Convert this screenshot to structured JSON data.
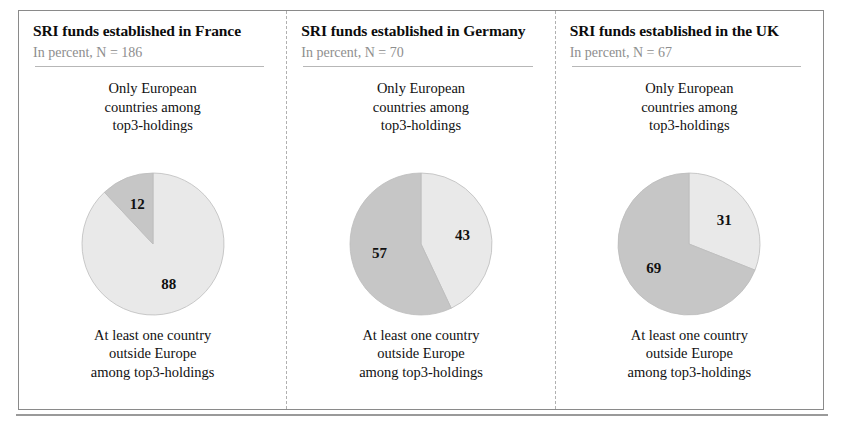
{
  "figure": {
    "border_color": "#8a8a8a",
    "separator_style": "dashed"
  },
  "palette": {
    "light_slice": "#e9e9e9",
    "dark_slice": "#c6c6c6",
    "slice_outline": "#bdbdbd",
    "title_color": "#0c0c0c",
    "subtitle_color": "#8e8e8e",
    "rule_color": "#b7b7b7"
  },
  "panels": [
    {
      "title": "SRI funds established in France",
      "subtitle": "In percent, N = 186",
      "caption_top": "Only European\ncountries among\ntop3-holdings",
      "caption_bottom": "At least one country\noutside Europe\namong top3-holdings",
      "values": {
        "light": "88",
        "dark": "12"
      }
    },
    {
      "title": "SRI funds established in Germany",
      "subtitle": "In percent, N = 70",
      "caption_top": "Only European\ncountries among\ntop3-holdings",
      "caption_bottom": "At least one country\noutside Europe\namong top3-holdings",
      "values": {
        "light": "43",
        "dark": "57"
      }
    },
    {
      "title": "SRI funds established in the UK",
      "subtitle": "In percent, N = 67",
      "caption_top": "Only European\ncountries among\ntop3-holdings",
      "caption_bottom": "At least one country\noutside Europe\namong top3-holdings",
      "values": {
        "light": "31",
        "dark": "69"
      }
    }
  ],
  "chart_data": [
    {
      "type": "pie",
      "title": "SRI funds established in France",
      "subtitle": "In percent, N = 186",
      "labels": [
        "Only European countries among top3-holdings",
        "At least one country outside Europe among top3-holdings"
      ],
      "values": [
        88,
        12
      ],
      "colors": [
        "#e9e9e9",
        "#c6c6c6"
      ],
      "units": "percent",
      "n": 186,
      "start_angle_deg": 0,
      "direction": "clockwise",
      "legend": "none",
      "grid": false
    },
    {
      "type": "pie",
      "title": "SRI funds established in Germany",
      "subtitle": "In percent, N = 70",
      "labels": [
        "Only European countries among top3-holdings",
        "At least one country outside Europe among top3-holdings"
      ],
      "values": [
        43,
        57
      ],
      "colors": [
        "#e9e9e9",
        "#c6c6c6"
      ],
      "units": "percent",
      "n": 70,
      "start_angle_deg": 0,
      "direction": "clockwise",
      "legend": "none",
      "grid": false
    },
    {
      "type": "pie",
      "title": "SRI funds established in the UK",
      "subtitle": "In percent, N = 67",
      "labels": [
        "Only European countries among top3-holdings",
        "At least one country outside Europe among top3-holdings"
      ],
      "values": [
        31,
        69
      ],
      "colors": [
        "#e9e9e9",
        "#c6c6c6"
      ],
      "units": "percent",
      "n": 67,
      "start_angle_deg": 0,
      "direction": "clockwise",
      "legend": "none",
      "grid": false
    }
  ]
}
